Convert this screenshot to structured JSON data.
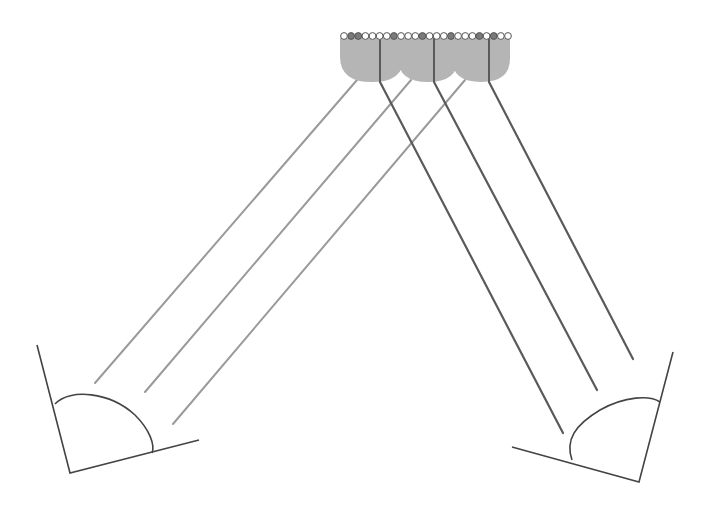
{
  "diagram": {
    "type": "optical-array-reflection",
    "canvas": {
      "width": 702,
      "height": 508,
      "background": "#ffffff"
    },
    "colors": {
      "lens_fill": "#b5b5b5",
      "light_ray": "#9a9a9a",
      "reflected_ray": "#5a5a5a",
      "outline": "#444444",
      "emitter_on": "#7a7a7a",
      "emitter_off": "#ffffff"
    },
    "emitter_row": {
      "y": 36,
      "x_start": 344,
      "x_end": 508,
      "count": 24,
      "radius": 3.4,
      "highlighted_indices": [
        1,
        2,
        7,
        11,
        15,
        19,
        21
      ]
    },
    "lenses": [
      {
        "cx": 372,
        "top": 38,
        "width": 64,
        "height": 44
      },
      {
        "cx": 428,
        "top": 38,
        "width": 60,
        "height": 44
      },
      {
        "cx": 481,
        "top": 38,
        "width": 58,
        "height": 44
      }
    ],
    "axis_lines": [
      {
        "x1": 380,
        "y1": 38,
        "x2": 380,
        "y2": 82
      },
      {
        "x1": 434,
        "y1": 38,
        "x2": 434,
        "y2": 82
      },
      {
        "x1": 489,
        "y1": 38,
        "x2": 489,
        "y2": 82
      }
    ],
    "incident_rays": [
      {
        "x1": 357,
        "y1": 80,
        "x2": 95,
        "y2": 383
      },
      {
        "x1": 411,
        "y1": 80,
        "x2": 145,
        "y2": 392
      },
      {
        "x1": 465,
        "y1": 80,
        "x2": 173,
        "y2": 424
      }
    ],
    "reflected_rays": [
      {
        "x1": 380,
        "y1": 82,
        "x2": 563,
        "y2": 433
      },
      {
        "x1": 434,
        "y1": 82,
        "x2": 597,
        "y2": 390
      },
      {
        "x1": 489,
        "y1": 82,
        "x2": 633,
        "y2": 359
      }
    ],
    "dishes": [
      {
        "name": "left-receiver",
        "frame": [
          [
            37,
            345
          ],
          [
            70,
            473
          ],
          [
            199,
            440
          ]
        ],
        "curve": "M55,404 C70,388 110,392 135,415 C150,430 155,445 152,453"
      },
      {
        "name": "right-receiver",
        "frame": [
          [
            673,
            352
          ],
          [
            639,
            482
          ],
          [
            512,
            447
          ]
        ],
        "curve": "M572,460 C565,440 575,425 600,410 C625,396 650,395 660,402"
      }
    ]
  }
}
